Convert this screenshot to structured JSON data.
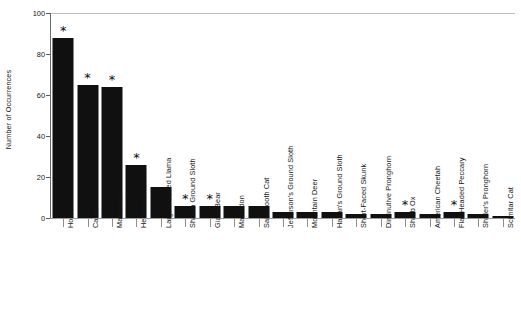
{
  "chart_data": {
    "type": "bar",
    "title": "",
    "xlabel": "",
    "ylabel": "Number of Occurrences",
    "ylim": [
      0,
      100
    ],
    "yticks": [
      0,
      20,
      40,
      60,
      80,
      100
    ],
    "grid": false,
    "legend": null,
    "bar_color": "#101010",
    "annotation_symbol": "*",
    "annotation_meaning": "asterisk marks above selected bars",
    "categories": [
      "Horse",
      "Camel",
      "Mammoth",
      "Helmeted  Muskox",
      "Large-Headed Llama",
      "Shasta Ground Sloth",
      "Giant Bear",
      "Mastodon",
      "Sabertooth Cat",
      "Jefferson's Ground Sloth",
      "Mountain Deer",
      "Harlan's Ground Sloth",
      "Short-Faced Skunk",
      "Diminutive Pronghorn",
      "Shrub Ox",
      "American Cheetah",
      "Flat-Headed Peccary",
      "Shuler's Pronghorn",
      "Scimitar Cat"
    ],
    "values": [
      88,
      65,
      64,
      26,
      15,
      6,
      6,
      6,
      6,
      3,
      3,
      3,
      2,
      2,
      3,
      2,
      3,
      2,
      1
    ],
    "starred": [
      true,
      true,
      true,
      true,
      false,
      true,
      true,
      false,
      false,
      false,
      false,
      false,
      false,
      false,
      true,
      false,
      true,
      false,
      false
    ]
  }
}
